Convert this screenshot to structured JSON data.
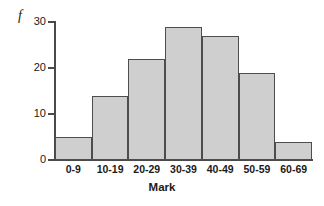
{
  "chart_data": {
    "type": "bar",
    "title": "",
    "subtitle": "",
    "xlabel": "Mark",
    "ylabel": "f",
    "categories": [
      "0-9",
      "10-19",
      "20-29",
      "30-39",
      "40-49",
      "50-59",
      "60-69"
    ],
    "values": [
      5,
      14,
      22,
      29,
      27,
      19,
      4
    ],
    "series": [
      {
        "name": "f",
        "values": [
          5,
          14,
          22,
          29,
          27,
          19,
          4
        ]
      }
    ],
    "ylim": [
      0,
      30
    ],
    "y_ticks": [
      0,
      10,
      20,
      30
    ],
    "y_tick_labels": [
      "0",
      "10",
      "20",
      "30"
    ],
    "grid": false,
    "legend": false,
    "legend_position": "none",
    "bar_fill_color": "#cfcfcf",
    "bar_border_color": "#4d4d4d",
    "axis_color": "#4a4a4a",
    "background_color": "#ffffff",
    "annotations": []
  }
}
